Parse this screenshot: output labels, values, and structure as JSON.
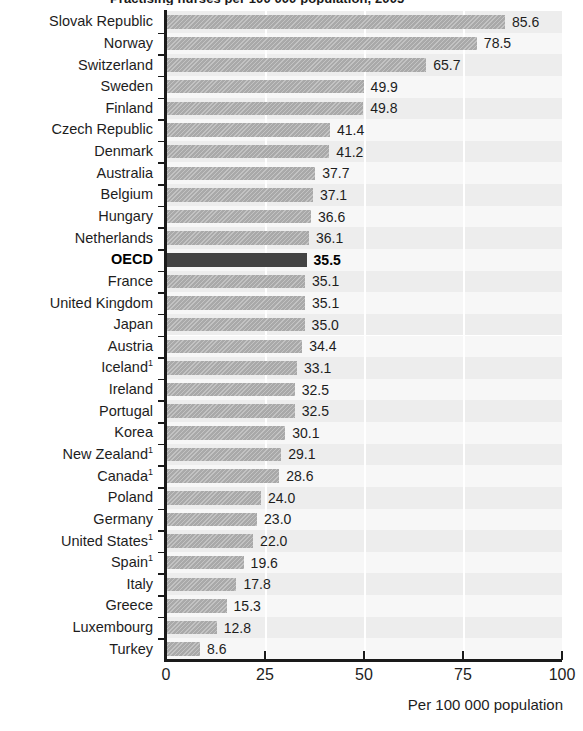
{
  "chart": {
    "title": "Practising nurses per 100 000 population, 2005",
    "x_axis_title": "Per 100 000 population",
    "highlight_label": "OECD"
  },
  "chart_data": {
    "type": "bar",
    "orientation": "horizontal",
    "title": "Practising nurses per 100 000 population, 2005",
    "xlabel": "Per 100 000 population",
    "ylabel": "",
    "xlim": [
      0,
      100
    ],
    "xticks": [
      "0",
      "25",
      "50",
      "75",
      "100"
    ],
    "grid": true,
    "legend": false,
    "highlight": "OECD",
    "footnote_marker": "1",
    "categories": [
      "Slovak Republic",
      "Norway",
      "Switzerland",
      "Sweden",
      "Finland",
      "Czech Republic",
      "Denmark",
      "Australia",
      "Belgium",
      "Hungary",
      "Netherlands",
      "OECD",
      "France",
      "United Kingdom",
      "Japan",
      "Austria",
      "Iceland",
      "Ireland",
      "Portugal",
      "Korea",
      "New Zealand",
      "Canada",
      "Poland",
      "Germany",
      "United States",
      "Spain",
      "Italy",
      "Greece",
      "Luxembourg",
      "Turkey"
    ],
    "values": [
      85.6,
      78.5,
      65.7,
      49.9,
      49.8,
      41.4,
      41.2,
      37.7,
      37.1,
      36.6,
      36.1,
      35.5,
      35.1,
      35.1,
      35.0,
      34.4,
      33.1,
      32.5,
      32.5,
      30.1,
      29.1,
      28.6,
      24.0,
      23.0,
      22.0,
      19.6,
      17.8,
      15.3,
      12.8,
      8.6
    ],
    "rows": [
      {
        "label": "Slovak Republic",
        "value": 85.6,
        "value_label": "85.6",
        "note": ""
      },
      {
        "label": "Norway",
        "value": 78.5,
        "value_label": "78.5",
        "note": ""
      },
      {
        "label": "Switzerland",
        "value": 65.7,
        "value_label": "65.7",
        "note": ""
      },
      {
        "label": "Sweden",
        "value": 49.9,
        "value_label": "49.9",
        "note": ""
      },
      {
        "label": "Finland",
        "value": 49.8,
        "value_label": "49.8",
        "note": ""
      },
      {
        "label": "Czech Republic",
        "value": 41.4,
        "value_label": "41.4",
        "note": ""
      },
      {
        "label": "Denmark",
        "value": 41.2,
        "value_label": "41.2",
        "note": ""
      },
      {
        "label": "Australia",
        "value": 37.7,
        "value_label": "37.7",
        "note": ""
      },
      {
        "label": "Belgium",
        "value": 37.1,
        "value_label": "37.1",
        "note": ""
      },
      {
        "label": "Hungary",
        "value": 36.6,
        "value_label": "36.6",
        "note": ""
      },
      {
        "label": "Netherlands",
        "value": 36.1,
        "value_label": "36.1",
        "note": ""
      },
      {
        "label": "OECD",
        "value": 35.5,
        "value_label": "35.5",
        "note": "",
        "highlight": true
      },
      {
        "label": "France",
        "value": 35.1,
        "value_label": "35.1",
        "note": ""
      },
      {
        "label": "United Kingdom",
        "value": 35.1,
        "value_label": "35.1",
        "note": ""
      },
      {
        "label": "Japan",
        "value": 35.0,
        "value_label": "35.0",
        "note": ""
      },
      {
        "label": "Austria",
        "value": 34.4,
        "value_label": "34.4",
        "note": ""
      },
      {
        "label": "Iceland",
        "value": 33.1,
        "value_label": "33.1",
        "note": "1"
      },
      {
        "label": "Ireland",
        "value": 32.5,
        "value_label": "32.5",
        "note": ""
      },
      {
        "label": "Portugal",
        "value": 32.5,
        "value_label": "32.5",
        "note": ""
      },
      {
        "label": "Korea",
        "value": 30.1,
        "value_label": "30.1",
        "note": ""
      },
      {
        "label": "New Zealand",
        "value": 29.1,
        "value_label": "29.1",
        "note": "1"
      },
      {
        "label": "Canada",
        "value": 28.6,
        "value_label": "28.6",
        "note": "1"
      },
      {
        "label": "Poland",
        "value": 24.0,
        "value_label": "24.0",
        "note": ""
      },
      {
        "label": "Germany",
        "value": 23.0,
        "value_label": "23.0",
        "note": ""
      },
      {
        "label": "United States",
        "value": 22.0,
        "value_label": "22.0",
        "note": "1"
      },
      {
        "label": "Spain",
        "value": 19.6,
        "value_label": "19.6",
        "note": "1"
      },
      {
        "label": "Italy",
        "value": 17.8,
        "value_label": "17.8",
        "note": ""
      },
      {
        "label": "Greece",
        "value": 15.3,
        "value_label": "15.3",
        "note": ""
      },
      {
        "label": "Luxembourg",
        "value": 12.8,
        "value_label": "12.8",
        "note": ""
      },
      {
        "label": "Turkey",
        "value": 8.6,
        "value_label": "8.6",
        "note": ""
      }
    ],
    "colors": {
      "bar": "#a9a9a9",
      "bar_highlight": "#434343",
      "band": "#ededed",
      "band_alt": "#f7f7f7",
      "axis": "#1a1a1a",
      "text": "#1d1d1d"
    }
  }
}
